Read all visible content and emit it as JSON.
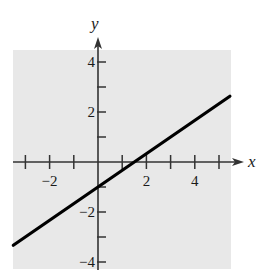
{
  "chart_data": {
    "type": "line",
    "title": "",
    "xlabel": "x",
    "ylabel": "y",
    "xlim": [
      -3.5,
      5.5
    ],
    "ylim": [
      -4.3,
      4.5
    ],
    "grid": false,
    "background": "#e8e8e8",
    "x_ticks": [
      -3,
      -2,
      -1,
      1,
      2,
      3,
      4,
      5
    ],
    "x_tick_labels": [
      {
        "value": -2,
        "label": "−2"
      },
      {
        "value": 2,
        "label": "2"
      },
      {
        "value": 4,
        "label": "4"
      }
    ],
    "y_ticks": [
      -4,
      -3,
      -2,
      -1,
      1,
      2,
      3,
      4
    ],
    "y_tick_labels": [
      {
        "value": 4,
        "label": "4"
      },
      {
        "value": 2,
        "label": "2"
      },
      {
        "value": -2,
        "label": "−2"
      },
      {
        "value": -4,
        "label": "−4"
      }
    ],
    "series": [
      {
        "name": "y = (2/3)x − 1",
        "equation": "y = (2/3)x - 1",
        "slope": 0.6667,
        "intercept": -1,
        "x": [
          -3.5,
          5.45
        ],
        "y": [
          -3.33,
          2.63
        ],
        "color": "#000000"
      }
    ]
  }
}
